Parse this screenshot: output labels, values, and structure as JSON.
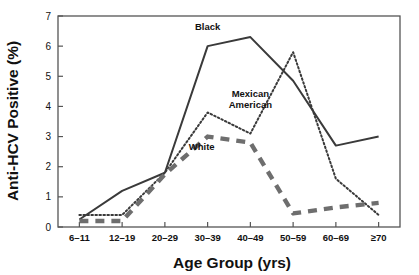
{
  "chart_data": {
    "type": "line",
    "title": "",
    "xlabel": "Age Group (yrs)",
    "ylabel": "Anti-HCV Positive (%)",
    "categories": [
      "6–11",
      "12–19",
      "20–29",
      "30–39",
      "40–49",
      "50–59",
      "60–69",
      "≥70"
    ],
    "ylim": [
      0,
      7
    ],
    "yticks": [
      "0",
      "1",
      "2",
      "3",
      "4",
      "5",
      "6",
      "7"
    ],
    "grid": false,
    "legend_position": "inline-annotations",
    "series": [
      {
        "name": "Black",
        "style": "solid",
        "color": "#3a3a3a",
        "values": [
          0.25,
          1.2,
          1.8,
          6.0,
          6.3,
          4.85,
          2.7,
          3.0
        ]
      },
      {
        "name": "Mexican American",
        "style": "dotted",
        "color": "#3a3a3a",
        "values": [
          0.4,
          0.4,
          1.8,
          3.8,
          3.1,
          5.8,
          1.6,
          0.4
        ]
      },
      {
        "name": "White",
        "style": "dashed",
        "color": "#6e6e6e",
        "values": [
          0.2,
          0.2,
          1.75,
          3.0,
          2.8,
          0.45,
          0.65,
          0.8
        ]
      }
    ],
    "annotations": [
      {
        "text": "Black",
        "x_category": "30–39",
        "value": 6.55
      },
      {
        "text": "Mexican",
        "x_category": "40–49",
        "value": 4.3
      },
      {
        "text": "American",
        "x_category": "40–49",
        "value": 3.95
      },
      {
        "text": "White",
        "x_category": "35",
        "value": 2.55
      }
    ]
  }
}
